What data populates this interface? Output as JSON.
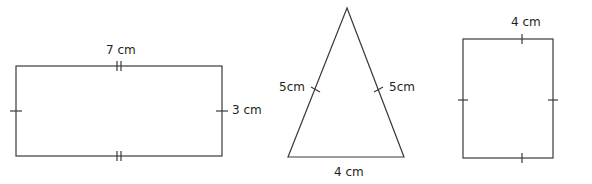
{
  "colors": {
    "stroke": "#3a3a3a",
    "text": "#231f20",
    "background": "#ffffff"
  },
  "shapes": [
    {
      "name": "rectangle",
      "labels": [
        {
          "id": "rect-top",
          "text": "7 cm",
          "x": 106,
          "y": 44
        },
        {
          "id": "rect-right",
          "text": "3 cm",
          "x": 232,
          "y": 104
        }
      ]
    },
    {
      "name": "isosceles-triangle",
      "labels": [
        {
          "id": "tri-left",
          "text": "5cm",
          "x": 279,
          "y": 81
        },
        {
          "id": "tri-right",
          "text": "5cm",
          "x": 389,
          "y": 81
        },
        {
          "id": "tri-base",
          "text": "4 cm",
          "x": 334,
          "y": 166
        }
      ]
    },
    {
      "name": "square",
      "labels": [
        {
          "id": "sq-top",
          "text": "4 cm",
          "x": 511,
          "y": 16
        }
      ]
    }
  ]
}
